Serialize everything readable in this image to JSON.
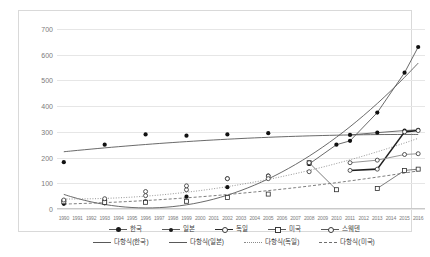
{
  "chart_data": {
    "type": "scatter",
    "title": "",
    "xlabel": "",
    "ylabel": "",
    "ylim": [
      0,
      700
    ],
    "yticks": [
      0,
      100,
      200,
      300,
      400,
      500,
      600,
      700
    ],
    "grid": true,
    "legend_position": "bottom",
    "categories": [
      "1990",
      "1991",
      "1992",
      "1993",
      "1994",
      "1995",
      "1996",
      "1997",
      "1998",
      "1999",
      "2000",
      "2001",
      "2002",
      "2003",
      "2004",
      "2005",
      "2006",
      "2007",
      "2008",
      "2009",
      "2010",
      "2011",
      "2012",
      "2013",
      "2014",
      "2015",
      "2016"
    ],
    "series": [
      {
        "name": "한국",
        "marker": "filled-circle",
        "line": "solid",
        "points": [
          {
            "x": "1990",
            "y": 20
          },
          {
            "x": "1993",
            "y": 22
          },
          {
            "x": "1996",
            "y": 30
          },
          {
            "x": "1999",
            "y": 48
          },
          {
            "x": "2002",
            "y": 85
          },
          {
            "x": "2005",
            "y": 130
          },
          {
            "x": "2008",
            "y": 175
          },
          {
            "x": "2010",
            "y": 250
          },
          {
            "x": "2011",
            "y": 265
          },
          {
            "x": "2013",
            "y": 375
          },
          {
            "x": "2015",
            "y": 530
          },
          {
            "x": "2016",
            "y": 630
          }
        ]
      },
      {
        "name": "일본",
        "marker": "filled-circle",
        "line": "solid",
        "points": [
          {
            "x": "1990",
            "y": 182
          },
          {
            "x": "1993",
            "y": 250
          },
          {
            "x": "1996",
            "y": 290
          },
          {
            "x": "1999",
            "y": 285
          },
          {
            "x": "2002",
            "y": 290
          },
          {
            "x": "2005",
            "y": 295
          },
          {
            "x": "2008",
            "y": 175
          },
          {
            "x": "2011",
            "y": 288
          },
          {
            "x": "2013",
            "y": 297
          },
          {
            "x": "2015",
            "y": 305
          },
          {
            "x": "2016",
            "y": 308
          }
        ]
      },
      {
        "name": "독일",
        "marker": "open-circle",
        "line": "solid-bold",
        "points": [
          {
            "x": "1990",
            "y": 30
          },
          {
            "x": "1993",
            "y": 35
          },
          {
            "x": "1996",
            "y": 52
          },
          {
            "x": "1999",
            "y": 75
          },
          {
            "x": "2002",
            "y": 118
          },
          {
            "x": "2005",
            "y": 128
          },
          {
            "x": "2008",
            "y": 145
          },
          {
            "x": "2011",
            "y": 150
          },
          {
            "x": "2013",
            "y": 155
          },
          {
            "x": "2015",
            "y": 300
          },
          {
            "x": "2016",
            "y": 305
          }
        ]
      },
      {
        "name": "미국",
        "marker": "open-square",
        "line": "dashed",
        "points": [
          {
            "x": "1990",
            "y": 28
          },
          {
            "x": "1993",
            "y": 25
          },
          {
            "x": "1996",
            "y": 26
          },
          {
            "x": "1999",
            "y": 30
          },
          {
            "x": "2002",
            "y": 45
          },
          {
            "x": "2005",
            "y": 58
          },
          {
            "x": "2008",
            "y": 180
          },
          {
            "x": "2010",
            "y": 75
          },
          {
            "x": "2013",
            "y": 80
          },
          {
            "x": "2015",
            "y": 150
          },
          {
            "x": "2016",
            "y": 155
          }
        ]
      },
      {
        "name": "스웨덴",
        "marker": "open-circle",
        "line": "dotted",
        "points": [
          {
            "x": "1990",
            "y": 35
          },
          {
            "x": "1993",
            "y": 40
          },
          {
            "x": "1996",
            "y": 68
          },
          {
            "x": "1999",
            "y": 90
          },
          {
            "x": "2002",
            "y": 118
          },
          {
            "x": "2005",
            "y": 118
          },
          {
            "x": "2008",
            "y": 180
          },
          {
            "x": "2011",
            "y": 180
          },
          {
            "x": "2013",
            "y": 190
          },
          {
            "x": "2015",
            "y": 212
          },
          {
            "x": "2016",
            "y": 215
          }
        ]
      }
    ],
    "trendlines": [
      {
        "name": "다항식(한국)",
        "style": "solid",
        "for": "한국"
      },
      {
        "name": "다항식(일본)",
        "style": "solid",
        "for": "일본"
      },
      {
        "name": "다항식(독일)",
        "style": "dotted",
        "for": "독일"
      },
      {
        "name": "다항식(미국)",
        "style": "dashed",
        "for": "미국"
      }
    ]
  },
  "legend": {
    "row1": [
      {
        "label": "한국",
        "marker": "filled-circle",
        "line": "solid"
      },
      {
        "label": "일본",
        "marker": "filled-circle-small",
        "line": "solid"
      },
      {
        "label": "독일",
        "marker": "open-circle",
        "line": "solid-bold"
      },
      {
        "label": "미국",
        "marker": "open-square",
        "line": "solid"
      },
      {
        "label": "스웨덴",
        "marker": "open-circle",
        "line": "solid"
      }
    ],
    "row2": [
      {
        "label": "다항식(한국)",
        "line": "solid"
      },
      {
        "label": "다항식(일본)",
        "line": "solid"
      },
      {
        "label": "다항식(독일)",
        "line": "dotted"
      },
      {
        "label": "다항식(미국)",
        "line": "dashed"
      }
    ]
  },
  "colors": {
    "grid": "#e6e6e6",
    "axis_text": "#7b7b7b",
    "series_dark": "#1a1a1a",
    "series_mid": "#595959",
    "frame": "#d9d9d9"
  }
}
